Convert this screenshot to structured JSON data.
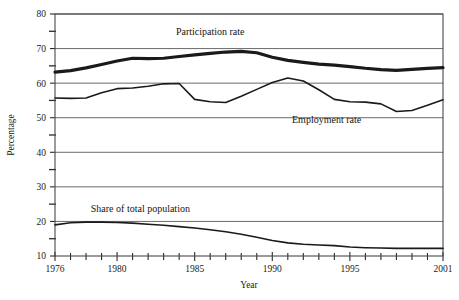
{
  "chart_data": {
    "type": "line",
    "title": "",
    "xlabel": "Year",
    "ylabel": "Percentage",
    "xlim": [
      1976,
      2001
    ],
    "ylim": [
      10,
      80
    ],
    "grid": "horizontal-major",
    "legend_position": "inline-annotations",
    "x": [
      1976,
      1977,
      1978,
      1979,
      1980,
      1981,
      1982,
      1983,
      1984,
      1985,
      1986,
      1987,
      1988,
      1989,
      1990,
      1991,
      1992,
      1993,
      1994,
      1995,
      1996,
      1997,
      1998,
      1999,
      2000,
      2001
    ],
    "x_major_ticks": [
      1976,
      1980,
      1985,
      1990,
      1995,
      2001
    ],
    "x_major_tick_labels": [
      "1976",
      "1980",
      "1985",
      "1990",
      "1995",
      "2001"
    ],
    "y_major_ticks": [
      10,
      20,
      30,
      40,
      50,
      60,
      70,
      80
    ],
    "y_major_tick_labels": [
      "10",
      "20",
      "30",
      "40",
      "50",
      "60",
      "70",
      "80"
    ],
    "y_minor_ticks": [
      15,
      25,
      35,
      45,
      55,
      65,
      75
    ],
    "series": [
      {
        "name": "Participation rate",
        "label": "Participation rate",
        "label_x": 1986.0,
        "label_y": 74.0,
        "line_width": 3.2,
        "color": "#1a1a1a",
        "values": [
          63.3,
          63.8,
          64.6,
          65.5,
          66.4,
          67.2,
          67.3,
          67.3,
          67.6,
          68.2,
          68.6,
          69.0,
          69.2,
          68.9,
          67.6,
          67.4,
          67.4,
          67.3,
          67.0,
          66.6,
          65.9,
          65.0,
          64.0,
          63.3,
          63.1,
          63.2
        ],
        "end_values_note": "rises at end to about 64.5 by 2001"
      },
      {
        "name": "Employment rate",
        "label": "Employment rate",
        "label_x": 1993.5,
        "label_y": 48.5,
        "line_width": 1.6,
        "color": "#1a1a1a",
        "values": [
          55.8,
          55.7,
          55.8,
          56.0,
          57.5,
          58.6,
          59.1,
          59.0,
          59.9,
          59.9,
          55.2,
          54.5,
          54.3,
          54.6,
          55.5,
          56.4,
          57.4,
          58.6,
          60.6,
          61.2,
          61.0,
          60.3,
          59.0,
          57.9,
          57.2,
          57.1
        ]
      },
      {
        "name": "Share of total population",
        "label": "Share of total population",
        "label_x": 1981.5,
        "label_y": 22.8,
        "line_width": 1.6,
        "color": "#1a1a1a",
        "values": [
          19.0,
          19.5,
          19.8,
          19.8,
          19.7,
          19.5,
          19.3,
          19.0,
          18.6,
          18.1,
          17.5,
          16.9,
          16.3,
          15.6,
          14.9,
          14.3,
          13.9,
          13.6,
          13.3,
          13.1,
          12.9,
          12.8,
          12.7,
          12.7,
          12.7,
          12.7
        ]
      }
    ],
    "series_traced_pixels": {
      "note": "Polyline vertex values read directly from the plotted curves.",
      "participation_rate": [
        [
          1976,
          63.2
        ],
        [
          1977,
          63.6
        ],
        [
          1978,
          64.4
        ],
        [
          1979,
          65.4
        ],
        [
          1980,
          66.4
        ],
        [
          1981,
          67.2
        ],
        [
          1982,
          67.1
        ],
        [
          1983,
          67.2
        ],
        [
          1984,
          67.7
        ],
        [
          1985,
          68.2
        ],
        [
          1986,
          68.6
        ],
        [
          1987,
          69.0
        ],
        [
          1988,
          69.2
        ],
        [
          1989,
          68.8
        ],
        [
          1990,
          67.5
        ],
        [
          1991,
          66.6
        ],
        [
          1992,
          66.0
        ],
        [
          1993,
          65.5
        ],
        [
          1994,
          65.2
        ],
        [
          1995,
          64.8
        ],
        [
          1996,
          64.3
        ],
        [
          1997,
          63.9
        ],
        [
          1998,
          63.7
        ],
        [
          1999,
          64.0
        ],
        [
          2000,
          64.3
        ],
        [
          2001,
          64.5
        ]
      ],
      "employment_rate": [
        [
          1976,
          55.7
        ],
        [
          1977,
          55.6
        ],
        [
          1978,
          55.7
        ],
        [
          1979,
          57.2
        ],
        [
          1980,
          58.4
        ],
        [
          1981,
          58.6
        ],
        [
          1982,
          59.1
        ],
        [
          1983,
          59.8
        ],
        [
          1984,
          59.9
        ],
        [
          1985,
          55.3
        ],
        [
          1986,
          54.6
        ],
        [
          1987,
          54.4
        ],
        [
          1988,
          56.2
        ],
        [
          1989,
          58.2
        ],
        [
          1990,
          60.2
        ],
        [
          1991,
          61.5
        ],
        [
          1992,
          60.6
        ],
        [
          1993,
          58.1
        ],
        [
          1994,
          55.3
        ],
        [
          1995,
          54.6
        ],
        [
          1996,
          54.5
        ],
        [
          1997,
          54.0
        ],
        [
          1998,
          51.8
        ],
        [
          1999,
          52.1
        ],
        [
          2000,
          53.6
        ],
        [
          2001,
          55.2
        ]
      ],
      "share_of_total_population": [
        [
          1976,
          19.0
        ],
        [
          1977,
          19.6
        ],
        [
          1978,
          19.8
        ],
        [
          1979,
          19.8
        ],
        [
          1980,
          19.7
        ],
        [
          1981,
          19.5
        ],
        [
          1982,
          19.2
        ],
        [
          1983,
          18.9
        ],
        [
          1984,
          18.5
        ],
        [
          1985,
          18.1
        ],
        [
          1986,
          17.6
        ],
        [
          1987,
          17.0
        ],
        [
          1988,
          16.3
        ],
        [
          1989,
          15.4
        ],
        [
          1990,
          14.5
        ],
        [
          1991,
          13.8
        ],
        [
          1992,
          13.4
        ],
        [
          1993,
          13.2
        ],
        [
          1994,
          13.0
        ],
        [
          1995,
          12.6
        ],
        [
          1996,
          12.4
        ],
        [
          1997,
          12.3
        ],
        [
          1998,
          12.2
        ],
        [
          1999,
          12.2
        ],
        [
          2000,
          12.2
        ],
        [
          2001,
          12.2
        ]
      ]
    }
  },
  "axes": {
    "x_title": "Year",
    "y_title": "Percentage"
  }
}
